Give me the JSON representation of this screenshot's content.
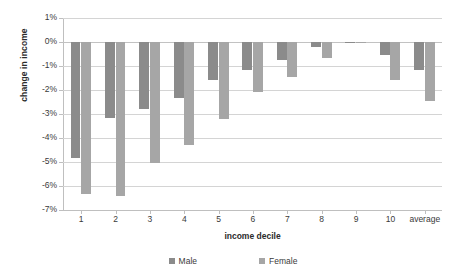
{
  "chart_data": {
    "type": "bar",
    "title": "",
    "xlabel": "income decile",
    "ylabel": "change in income",
    "categories": [
      "1",
      "2",
      "3",
      "4",
      "5",
      "6",
      "7",
      "8",
      "9",
      "10",
      "average"
    ],
    "series": [
      {
        "name": "Male",
        "color": "#8b8b8b",
        "values": [
          -4.85,
          -3.15,
          -2.8,
          -2.35,
          -1.6,
          -1.15,
          -0.75,
          -0.2,
          -0.05,
          -0.55,
          -1.15
        ]
      },
      {
        "name": "Female",
        "color": "#a6a6a6",
        "values": [
          -6.35,
          -6.4,
          -5.05,
          -4.3,
          -3.2,
          -2.1,
          -1.45,
          -0.65,
          -0.05,
          -1.6,
          -2.45
        ]
      }
    ],
    "ylim": [
      -7,
      1
    ],
    "ytick_labels": [
      "1%",
      "0%",
      "-1%",
      "-2%",
      "-3%",
      "-4%",
      "-5%",
      "-6%",
      "-7%"
    ],
    "ytick_values": [
      1,
      0,
      -1,
      -2,
      -3,
      -4,
      -5,
      -6,
      -7
    ],
    "grid": true,
    "legend_position": "bottom",
    "value_suffix": "%"
  },
  "legend": {
    "items": [
      {
        "label": "Male",
        "marker": "square-swatch-male"
      },
      {
        "label": "Female",
        "marker": "square-swatch-female"
      }
    ]
  },
  "axes": {
    "y_title": "change in income",
    "x_title": "income decile"
  }
}
